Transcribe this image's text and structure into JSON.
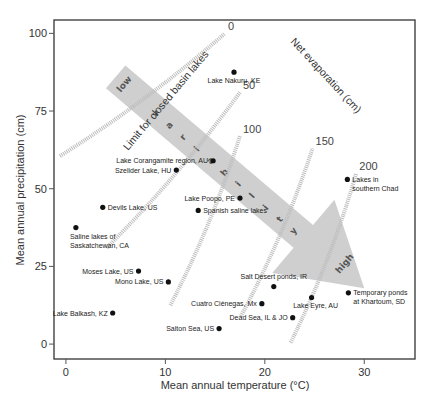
{
  "chart_data": {
    "type": "scatter",
    "title": "",
    "xlabel": "Mean annual temperature (°C)",
    "ylabel": "Mean annual precipitation (cm)",
    "xlim": [
      -1.2,
      35.1
    ],
    "ylim": [
      -4.8,
      104.3
    ],
    "xticks": [
      0,
      10,
      20,
      30
    ],
    "yticks": [
      0,
      25,
      50,
      75,
      100
    ],
    "grid": false,
    "points": [
      {
        "label": "Lake Nakuru, KE",
        "x": 16.9,
        "y": 87.5,
        "label_pos": "below"
      },
      {
        "label": "Lake Corangamite region, AU",
        "x": 14.8,
        "y": 59,
        "label_pos": "left"
      },
      {
        "label": "Szelider Lake, HU",
        "x": 11.1,
        "y": 56,
        "label_pos": "left"
      },
      {
        "label": "Devils Lake, US",
        "x": 3.7,
        "y": 44,
        "label_pos": "right"
      },
      {
        "label": "Saline lakes of Saskatchewan, CA",
        "x": 1.0,
        "y": 37.5,
        "label_pos": "below"
      },
      {
        "label": "Lake Poopo, PE",
        "x": 17.5,
        "y": 47,
        "label_pos": "left"
      },
      {
        "label": "Spanish saline lakes",
        "x": 13.3,
        "y": 43,
        "label_pos": "right"
      },
      {
        "label": "Lakes in southern Chad",
        "x": 28.3,
        "y": 53,
        "label_pos": "right"
      },
      {
        "label": "Moses Lake, US",
        "x": 7.3,
        "y": 23.5,
        "label_pos": "left"
      },
      {
        "label": "Mono Lake, US",
        "x": 10.3,
        "y": 20,
        "label_pos": "left"
      },
      {
        "label": "Lake Balkash, KZ",
        "x": 4.7,
        "y": 10,
        "label_pos": "left"
      },
      {
        "label": "Salton Sea, US",
        "x": 15.4,
        "y": 5,
        "label_pos": "left"
      },
      {
        "label": "Cuatro Ciénegas, Mx",
        "x": 19.7,
        "y": 13,
        "label_pos": "left"
      },
      {
        "label": "Salt Desert ponds, IR",
        "x": 20.9,
        "y": 18.5,
        "label_pos": "above"
      },
      {
        "label": "Lake Eyre, AU",
        "x": 24.7,
        "y": 15,
        "label_pos": "below-left"
      },
      {
        "label": "Dead Sea, IL & JO",
        "x": 22.8,
        "y": 8.5,
        "label_pos": "left"
      },
      {
        "label": "Temporary ponds at Khartoum, SD",
        "x": 28.4,
        "y": 16.5,
        "label_pos": "right"
      }
    ],
    "evaporation_isolines": {
      "title": "Net evaporation (cm)",
      "lines": [
        {
          "label": "0",
          "from": [
            -0.6,
            60.5
          ],
          "to": [
            16,
            100
          ]
        },
        {
          "label": "50",
          "from": [
            4.1,
            31
          ],
          "to": [
            17.5,
            81
          ]
        },
        {
          "label": "100",
          "from": [
            10.5,
            12.5
          ],
          "to": [
            17.5,
            67
          ]
        },
        {
          "label": "150",
          "from": [
            17.6,
            9
          ],
          "to": [
            24.8,
            63
          ]
        },
        {
          "label": "200",
          "from": [
            22.6,
            0.5
          ],
          "to": [
            29.2,
            55
          ]
        }
      ]
    },
    "annotations": {
      "limit_line": "Limit for closed basin lakes",
      "variability_arrow": {
        "start": "low",
        "middle": "variability",
        "end": "high",
        "from": [
          5,
          86
        ],
        "to": [
          30,
          18
        ]
      }
    }
  }
}
